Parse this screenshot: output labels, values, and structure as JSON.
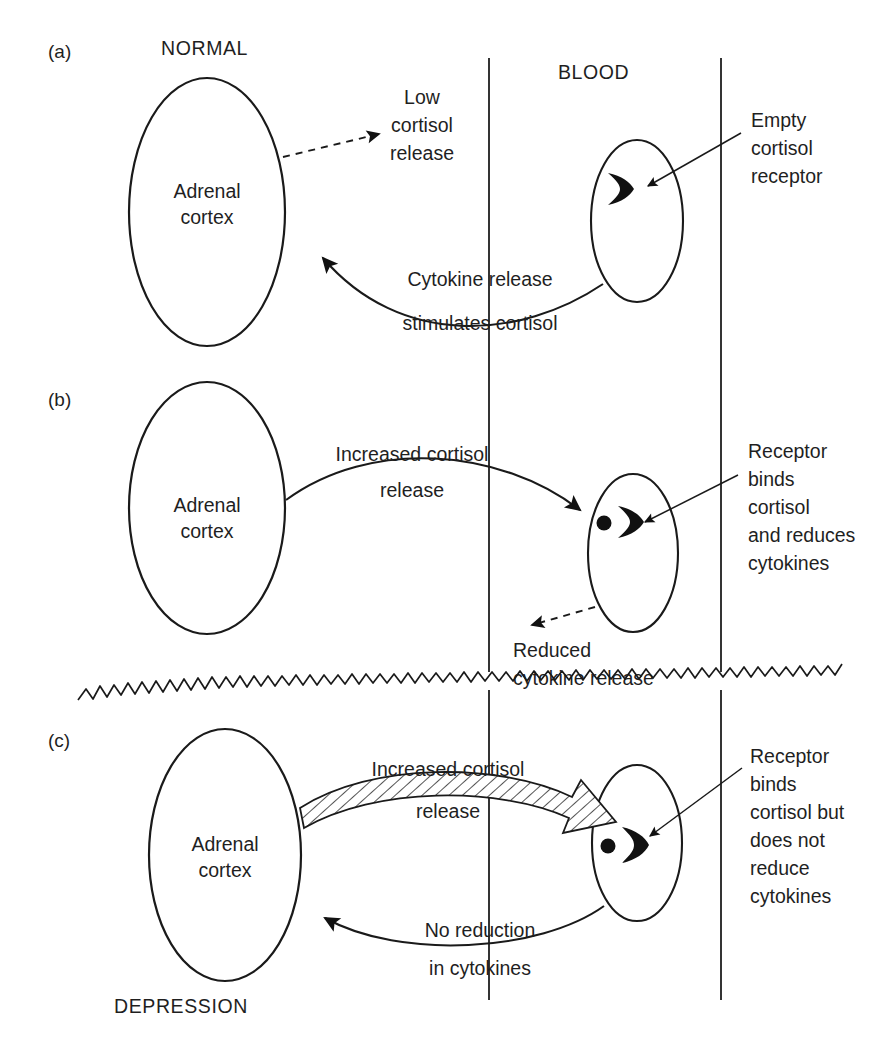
{
  "figure": {
    "canvas": {
      "width": 886,
      "height": 1051
    },
    "ink_color": "#1a1a1a",
    "background_color": "#ffffff"
  },
  "region_labels": {
    "normal": "NORMAL",
    "blood": "BLOOD",
    "depression": "DEPRESSION"
  },
  "panels": [
    {
      "id": "a",
      "letter": "(a)",
      "state_label": "NORMAL",
      "organ_label_line1": "Adrenal",
      "organ_label_line2": "cortex",
      "annotations": [
        {
          "name": "low-cortisol-release",
          "lines": [
            "Low",
            "cortisol",
            "release"
          ],
          "arrow_style": "dashed"
        },
        {
          "name": "empty-cortisol-receptor",
          "lines": [
            "Empty",
            "cortisol",
            "receptor"
          ],
          "arrow_style": "leader"
        },
        {
          "name": "cytokine-release-stimulates-cortisol",
          "lines": [
            "Cytokine release",
            "stimulates cortisol"
          ],
          "arrow_style": "solid"
        }
      ],
      "receptor_state": "empty",
      "cortisol_bound": false
    },
    {
      "id": "b",
      "letter": "(b)",
      "state_label": "",
      "organ_label_line1": "Adrenal",
      "organ_label_line2": "cortex",
      "annotations": [
        {
          "name": "increased-cortisol-release",
          "lines": [
            "Increased cortisol",
            "release"
          ],
          "arrow_style": "solid"
        },
        {
          "name": "receptor-binds-cortisol-reduces-cytokines",
          "lines": [
            "Receptor",
            "binds",
            "cortisol",
            "and reduces",
            "cytokines"
          ],
          "arrow_style": "leader"
        },
        {
          "name": "reduced-cytokine-release",
          "lines": [
            "Reduced",
            "cytokine release"
          ],
          "arrow_style": "dashed"
        }
      ],
      "receptor_state": "bound",
      "cortisol_bound": true
    },
    {
      "id": "c",
      "letter": "(c)",
      "state_label": "DEPRESSION",
      "organ_label_line1": "Adrenal",
      "organ_label_line2": "cortex",
      "annotations": [
        {
          "name": "increased-cortisol-release",
          "lines": [
            "Increased cortisol",
            "release"
          ],
          "arrow_style": "hatched-block"
        },
        {
          "name": "receptor-binds-cortisol-but-no-reduction",
          "lines": [
            "Receptor",
            "binds",
            "cortisol but",
            "does not",
            "reduce",
            "cytokines"
          ],
          "arrow_style": "leader"
        },
        {
          "name": "no-reduction-in-cytokines",
          "lines": [
            "No reduction",
            "in cytokines"
          ],
          "arrow_style": "solid"
        }
      ],
      "receptor_state": "bound",
      "cortisol_bound": true
    }
  ],
  "text": {
    "panel_a_letter": "(a)",
    "panel_b_letter": "(b)",
    "panel_c_letter": "(c)",
    "normal": "NORMAL",
    "blood": "BLOOD",
    "depression": "DEPRESSION",
    "adrenal": "Adrenal",
    "cortex": "cortex",
    "low": "Low",
    "cortisol": "cortisol",
    "release": "release",
    "empty": "Empty",
    "receptor": "receptor",
    "cytokine_release": "Cytokine release",
    "stimulates_cortisol": "stimulates cortisol",
    "increased_cortisol": "Increased cortisol",
    "receptor_word": "Receptor",
    "binds": "binds",
    "and_reduces": "and reduces",
    "cytokines": "cytokines",
    "reduced": "Reduced",
    "cytokine_release_lc": "cytokine release",
    "cortisol_but": "cortisol but",
    "does_not": "does not",
    "reduce": "reduce",
    "no_reduction": "No reduction",
    "in_cytokines": "in cytokines"
  },
  "icons": {
    "receptor_crescent": "crescent-receptor-icon",
    "cortisol_molecule": "cortisol-dot-icon",
    "arrowhead": "arrowhead-icon",
    "wavy_break": "wavy-break-icon"
  }
}
